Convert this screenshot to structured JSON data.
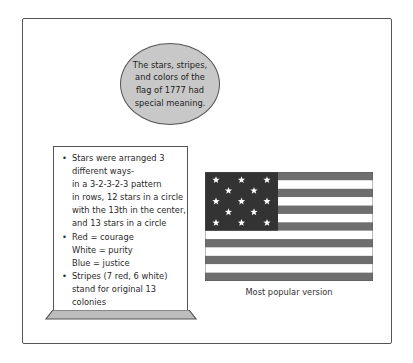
{
  "callout": {
    "lines": [
      "The stars, stripes,",
      "and colors of the",
      "flag of 1777 had",
      "special meaning."
    ]
  },
  "notecard": {
    "bullets": [
      {
        "lines": [
          "Stars were arranged 3",
          "different ways-",
          "in a 3-2-3-2-3 pattern",
          "in rows, 12 stars in a circle",
          "with the 13th in the center,",
          "and 13 stars in a circle"
        ]
      },
      {
        "lines": [
          "Red = courage",
          "White = purity",
          "Blue = justice"
        ]
      },
      {
        "lines": [
          "Stripes (7 red, 6 white)",
          "stand for original 13",
          "colonies"
        ]
      }
    ]
  },
  "flag": {
    "stripe_count": 13,
    "star_count": 13,
    "star_pattern": "3-2-3-2-3",
    "colors": {
      "dark_stripe": "#6e6e6e",
      "light_stripe": "#ffffff",
      "canton": "#333333",
      "star": "#ffffff"
    },
    "caption": "Most popular version"
  },
  "colors": {
    "callout_fill": "#c8c8c8",
    "outline": "#555555",
    "card_base": "#bdbdbd"
  }
}
